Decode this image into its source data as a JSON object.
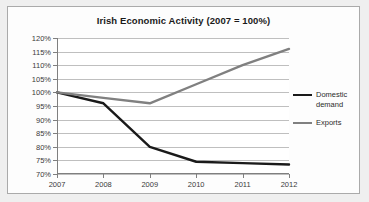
{
  "chart_data": {
    "type": "line",
    "title": "Irish Economic Activity (2007 = 100%)",
    "xlabel": "",
    "ylabel": "",
    "x": [
      "2007",
      "2008",
      "2009",
      "2010",
      "2011",
      "2012"
    ],
    "categories": [
      "2007",
      "2008",
      "2009",
      "2010",
      "2011",
      "2012"
    ],
    "series": [
      {
        "name": "Domestic demand",
        "color": "#1a1a1a",
        "values": [
          100,
          96,
          80,
          74.5,
          74,
          73.5
        ]
      },
      {
        "name": "Exports",
        "color": "#808080",
        "values": [
          100,
          98,
          96,
          103,
          110,
          116
        ]
      }
    ],
    "ylim": [
      70,
      120
    ],
    "ytick_labels": [
      "120%",
      "115%",
      "110%",
      "105%",
      "100%",
      "95%",
      "90%",
      "85%",
      "80%",
      "75%",
      "70%"
    ],
    "ytick_values": [
      120,
      115,
      110,
      105,
      100,
      95,
      90,
      85,
      80,
      75,
      70
    ],
    "grid": true,
    "legend_position": "right",
    "value_suffix": "%"
  },
  "legend": {
    "entries": [
      {
        "label": "Domestic demand"
      },
      {
        "label": "Exports"
      }
    ]
  }
}
